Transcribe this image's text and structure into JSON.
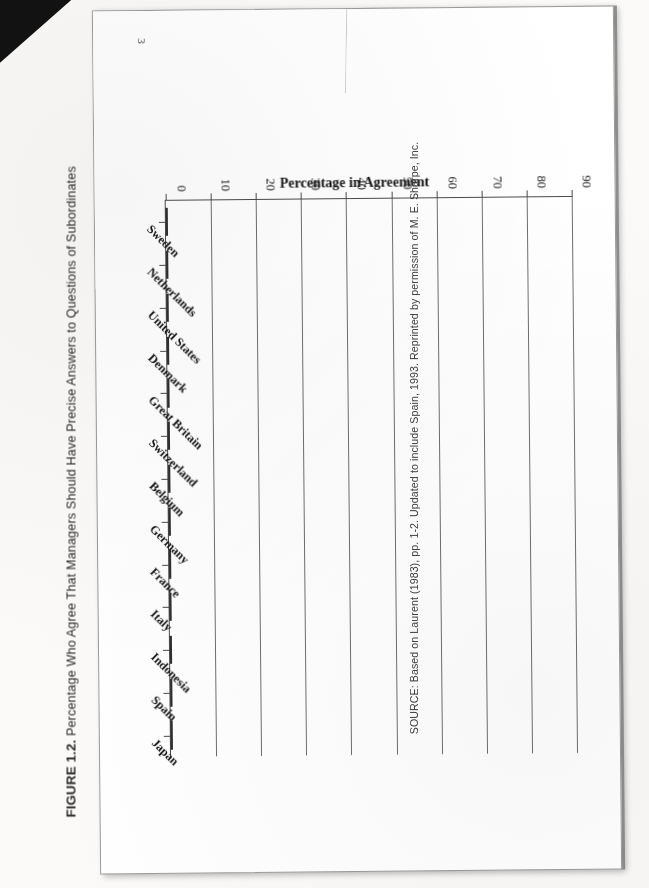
{
  "page_number": "3",
  "caption": {
    "label": "FIGURE 1.2.",
    "text": "Percentage Who Agree That Managers Should Have Precise Answers to Questions of Subordinates"
  },
  "source": {
    "text": "SOURCE: Based on Laurent (1983), pp. 1-2. Updated to include Spain, 1993. Reprinted by permission of M. E. Sharpe, Inc."
  },
  "chart_data": {
    "type": "bar",
    "orientation": "horizontal-on-page",
    "title": "Percentage Who Agree That Managers Should Have Precise Answers to Questions of Subordinates",
    "xlabel": "",
    "ylabel": "Percentage in Agreement",
    "ylim": [
      0,
      90
    ],
    "ytick_labels": [
      "90",
      "80",
      "70",
      "60",
      "50",
      "40",
      "30",
      "20",
      "10",
      "0"
    ],
    "ytick_values": [
      90,
      80,
      70,
      60,
      50,
      40,
      30,
      20,
      10,
      0
    ],
    "grid": true,
    "legend": false,
    "bar_fill": "#8e8e8e",
    "bar_edge": "#2f2f2f",
    "categories": [
      "Sweden",
      "Netherlands",
      "United States",
      "Denmark",
      "Great Britain",
      "Switzerland",
      "Belgium",
      "Germany",
      "France",
      "Italy",
      "Indonesia",
      "Spain",
      "Japan"
    ],
    "values": [
      10,
      17,
      18,
      23,
      27,
      38,
      44,
      46,
      53,
      66,
      73,
      78,
      78
    ]
  }
}
